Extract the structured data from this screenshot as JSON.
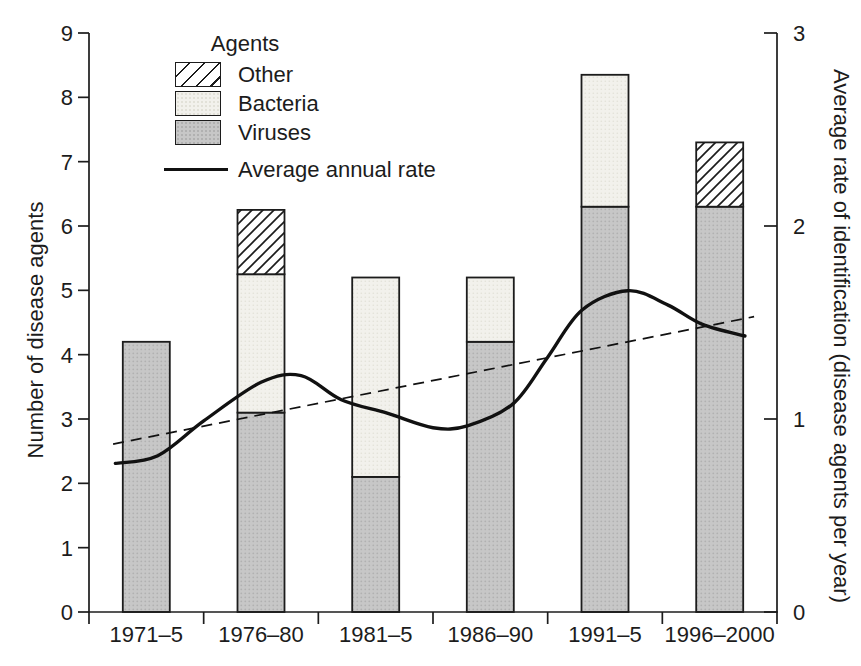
{
  "chart_data": {
    "type": "bar",
    "subtype": "stacked-bar-with-line-overlay",
    "title": "",
    "categories": [
      "1971–5",
      "1976–80",
      "1981–5",
      "1986–90",
      "1991–5",
      "1996–2000"
    ],
    "series": [
      {
        "name": "Viruses",
        "type": "bar-segment",
        "fill": "viruses",
        "values": [
          4.2,
          3.1,
          2.1,
          4.2,
          6.3,
          6.3
        ]
      },
      {
        "name": "Bacteria",
        "type": "bar-segment",
        "fill": "bacteria",
        "values": [
          0,
          2.15,
          3.1,
          1.0,
          2.05,
          0
        ]
      },
      {
        "name": "Other",
        "type": "bar-segment",
        "fill": "hatch",
        "values": [
          0,
          1.0,
          0,
          0,
          0,
          1.0
        ]
      }
    ],
    "bar_totals": [
      4.2,
      6.25,
      5.2,
      5.2,
      8.35,
      7.3
    ],
    "line_series": {
      "name": "Average annual rate",
      "axis": "right",
      "style": "solid",
      "points": [
        [
          0.23,
          0.77
        ],
        [
          0.6,
          0.81
        ],
        [
          1.0,
          0.99
        ],
        [
          1.5,
          1.19
        ],
        [
          1.85,
          1.225
        ],
        [
          2.2,
          1.1
        ],
        [
          2.6,
          1.03
        ],
        [
          3.0,
          0.955
        ],
        [
          3.3,
          0.965
        ],
        [
          3.7,
          1.08
        ],
        [
          4.0,
          1.32
        ],
        [
          4.3,
          1.565
        ],
        [
          4.7,
          1.665
        ],
        [
          5.05,
          1.59
        ],
        [
          5.35,
          1.49
        ],
        [
          5.72,
          1.43
        ]
      ]
    },
    "trend_line": {
      "axis": "right",
      "style": "dashed",
      "points": [
        [
          0.21,
          0.87
        ],
        [
          5.8,
          1.53
        ]
      ]
    },
    "left_axis": {
      "label": "Number of disease agents",
      "min": 0,
      "max": 9,
      "ticks": [
        0,
        1,
        2,
        3,
        4,
        5,
        6,
        7,
        8,
        9
      ]
    },
    "right_axis": {
      "label": "Average rate of identification (disease agents per year)",
      "min": 0,
      "max": 3,
      "ticks": [
        0,
        1,
        2,
        3
      ]
    },
    "legend": {
      "title": "Agents",
      "items": [
        {
          "label": "Other",
          "swatch": "hatch"
        },
        {
          "label": "Bacteria",
          "swatch": "bacteria"
        },
        {
          "label": "Viruses",
          "swatch": "viruses"
        }
      ],
      "line_label": "Average annual rate"
    },
    "grid": "off",
    "legend_position": "top-left-inside",
    "colors": {
      "ink": "#1c1c1c",
      "viruses": "#c7c7c7",
      "viruses_dot": "#b1b1b1",
      "bacteria": "#f2f1ec",
      "bacteria_dot": "#e2e1d8",
      "hatch_bg": "#ffffff",
      "line": "#111111",
      "background": "#ffffff"
    }
  }
}
